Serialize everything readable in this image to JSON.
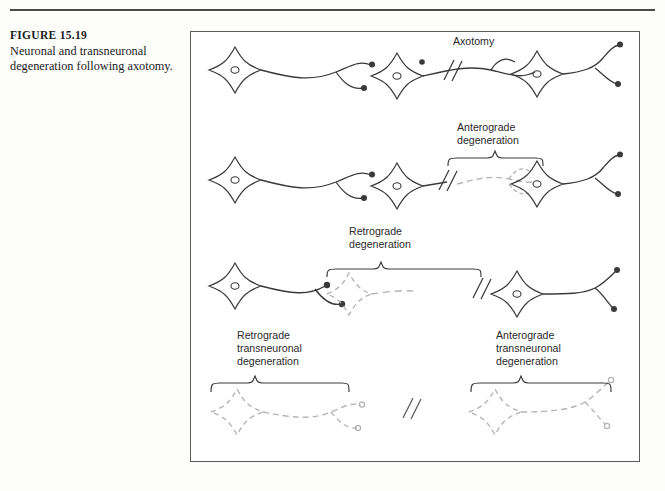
{
  "page": {
    "background_color": "#fdfdfc",
    "rule_color": "#4a4a4a"
  },
  "caption": {
    "figure_number": "FIGURE 15.19",
    "text": "Neuronal and transneuronal degeneration following axotomy."
  },
  "figure": {
    "border_color": "#5a5a5a",
    "background_color": "#ffffff",
    "intact_color": "#3a3a3a",
    "degenerated_color": "#b4b4b4",
    "label_color": "#2a2a2a",
    "rows": [
      {
        "id": "row-1-normal",
        "description": "Intact three-neuron chain with axotomy cut",
        "labels": [
          {
            "id": "axotomy",
            "lines": [
              "Axotomy"
            ],
            "x": 452,
            "y": 44
          }
        ],
        "cut_marks": [
          {
            "x": 258,
            "y": 40
          }
        ],
        "brace": null
      },
      {
        "id": "row-2-anterograde",
        "description": "Anterograde degeneration of distal axon segment and second cell",
        "labels": [
          {
            "id": "anterograde-degeneration",
            "lines": [
              "Anterograde",
              "degeneration"
            ],
            "x": 500,
            "y": 122
          }
        ],
        "cut_marks": [
          {
            "x": 253,
            "y": 147
          }
        ],
        "brace": {
          "x1": 257,
          "x2": 355,
          "y": 131
        }
      },
      {
        "id": "row-3-retrograde",
        "description": "Retrograde degeneration of second cell body and proximal axon",
        "labels": [
          {
            "id": "retrograde-degeneration",
            "lines": [
              "Retrograde",
              "degeneration"
            ],
            "x": 390,
            "y": 226
          }
        ],
        "cut_marks": [
          {
            "x": 288,
            "y": 252
          }
        ],
        "brace": {
          "x1": 135,
          "x2": 290,
          "y": 243
        }
      },
      {
        "id": "row-4-transneuronal",
        "description": "Retrograde and anterograde transneuronal degeneration; both remaining cells degenerate",
        "labels": [
          {
            "id": "retrograde-transneuronal-degeneration",
            "lines": [
              "Retrograde",
              "transneuronal",
              "degeneration"
            ],
            "x": 88,
            "y": 337
          },
          {
            "id": "anterograde-transneuronal-degeneration",
            "lines": [
              "Anterograde",
              "transneuronal",
              "degeneration"
            ],
            "x": 347,
            "y": 337
          }
        ],
        "cut_marks": [
          {
            "x": 245,
            "y": 378
          }
        ],
        "braces": [
          {
            "x1": 22,
            "x2": 160,
            "y": 370
          },
          {
            "x1": 280,
            "x2": 420,
            "y": 370
          }
        ]
      }
    ]
  }
}
